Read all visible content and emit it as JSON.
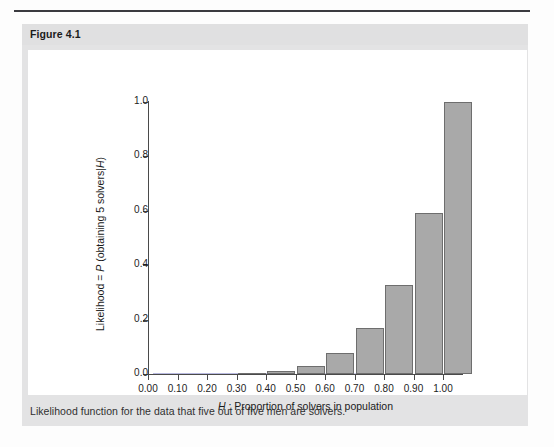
{
  "page": {
    "figure_label": "Figure 4.1",
    "caption": "Likelihood function for the data that five out of five men are solvers."
  },
  "colors": {
    "bar_fill": "#a9a9a9",
    "bar_stroke": "#6e6e6e",
    "axis": "#4a4a4a",
    "panel_bg": "#e3e3e4",
    "header_bg": "#e0e0e1",
    "plot_bg": "#ffffff",
    "rule": "#3b3b40"
  },
  "chart_data": {
    "type": "bar",
    "title": "",
    "xlabel": "H : Proportion of solvers in population",
    "xlabel_italic_part": "H",
    "ylabel": "Likelihood = P (obtaining 5 solvers|H)",
    "ylabel_italic_parts": [
      "P",
      "H"
    ],
    "categories": [
      "0.00",
      "0.10",
      "0.20",
      "0.30",
      "0.40",
      "0.50",
      "0.60",
      "0.70",
      "0.80",
      "0.90",
      "1.00"
    ],
    "x": [
      0.0,
      0.1,
      0.2,
      0.3,
      0.4,
      0.5,
      0.6,
      0.7,
      0.8,
      0.9,
      1.0
    ],
    "values": [
      0.0,
      1e-05,
      0.00032,
      0.00243,
      0.01024,
      0.03125,
      0.07776,
      0.16807,
      0.32768,
      0.59049,
      1.0
    ],
    "xtick_labels": [
      "0.00",
      "0.10",
      "0.20",
      "0.30",
      "0.40",
      "0.50",
      "0.60",
      "0.70",
      "0.80",
      "0.90",
      "1.00"
    ],
    "ytick_labels": [
      "0.0",
      "0.2",
      "0.4",
      "0.6",
      "0.8",
      "1.0"
    ],
    "ytick_values": [
      0.0,
      0.2,
      0.4,
      0.6,
      0.8,
      1.0
    ],
    "xlim": [
      -0.05,
      1.08
    ],
    "ylim": [
      0.0,
      1.0
    ],
    "grid": false,
    "legend": false
  }
}
